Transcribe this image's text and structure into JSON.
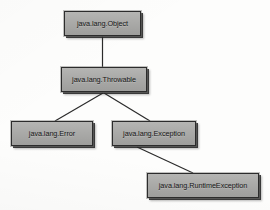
{
  "diagram": {
    "background_color": "#fdfdfc",
    "node_fill_color": "#aaaaa8",
    "node_border_color": "#2c2c2c",
    "edge_color": "#2b2b2b",
    "nodes": [
      {
        "id": "object",
        "label": "java.lang.Object"
      },
      {
        "id": "throwable",
        "label": "java.lang.Throwable"
      },
      {
        "id": "error",
        "label": "java.lang.Error"
      },
      {
        "id": "exception",
        "label": "java.lang.Exception"
      },
      {
        "id": "runtimeexc",
        "label": "java.lang.RuntimeException"
      }
    ],
    "edges": [
      {
        "from": "object",
        "to": "throwable"
      },
      {
        "from": "throwable",
        "to": "error"
      },
      {
        "from": "throwable",
        "to": "exception"
      },
      {
        "from": "exception",
        "to": "runtimeexc"
      }
    ]
  }
}
